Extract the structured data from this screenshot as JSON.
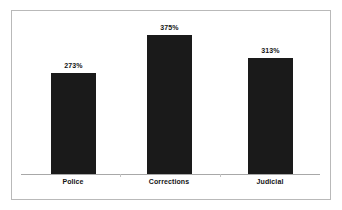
{
  "chart_data": {
    "type": "bar",
    "title": "",
    "subtitle": "",
    "xlabel": "",
    "ylabel": "",
    "categories": [
      "Police",
      "Corrections",
      "Judicial"
    ],
    "values": [
      273,
      375,
      313
    ],
    "value_labels": [
      "273%",
      "375%",
      "313%"
    ],
    "unit": "%",
    "ylim": [
      0,
      420
    ],
    "grid": false,
    "legend": false,
    "legend_position": "none",
    "series": [
      {
        "name": "Growth",
        "values": [
          273,
          375,
          313
        ]
      }
    ],
    "colors": {
      "bar": "#1a1a1a",
      "axis_line": "#a8a8a8",
      "frame_border": "#b9b9b9",
      "background": "#ffffff",
      "label_text": "#141414"
    }
  }
}
